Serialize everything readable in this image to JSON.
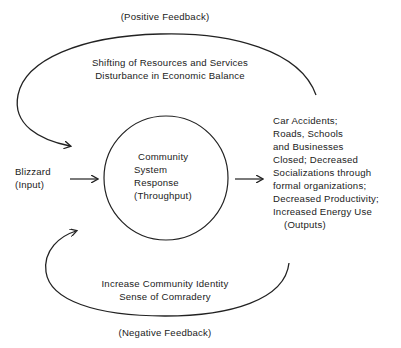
{
  "diagram": {
    "type": "systems-feedback-loop",
    "positive_feedback": {
      "label": "(Positive Feedback)",
      "line1": "Shifting of Resources and Services",
      "line2": "Disturbance in Economic Balance"
    },
    "input": {
      "line1": "Blizzard",
      "line2": "(Input)"
    },
    "throughput": {
      "line1": "Community",
      "line2": "System",
      "line3": "Response",
      "line4": "(Throughput)"
    },
    "outputs": {
      "lines": [
        "Car Accidents;",
        "Roads, Schools",
        "and Businesses",
        "Closed; Decreased",
        "Socializations through",
        "formal organizations;",
        "Decreased Productivity;",
        "Increased Energy Use"
      ],
      "label": "(Outputs)"
    },
    "negative_feedback": {
      "line1": "Increase Community Identity",
      "line2": "Sense of Comradery",
      "label": "(Negative Feedback)"
    },
    "colors": {
      "line": "#222222",
      "background": "#ffffff"
    }
  }
}
